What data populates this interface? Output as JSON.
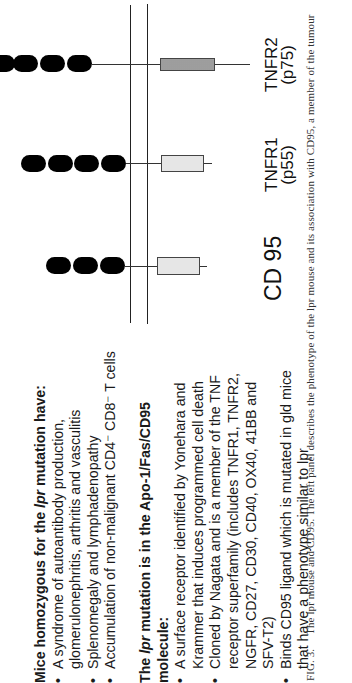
{
  "figure": {
    "orientation": "rotated-90-ccw",
    "receptors": [
      {
        "id": "tnfr2",
        "name": "TNFR2",
        "subname": "(p75)",
        "extracellular_domains": 4,
        "cytoplasmic_box": "dotted"
      },
      {
        "id": "tnfr1",
        "name": "TNFR1",
        "subname": "(p55)",
        "extracellular_domains": 4,
        "cytoplasmic_box": "light"
      },
      {
        "id": "cd95",
        "name": "CD 95",
        "subname": "",
        "extracellular_domains": 3,
        "cytoplasmic_box": "light"
      }
    ],
    "membrane": "double-line",
    "colors": {
      "domain": "#000000",
      "box_light": "#e6e6e6",
      "box_dotted": "#bdbdbd",
      "line": "#222222"
    }
  },
  "left_panel": {
    "section1": {
      "heading_pre": "Mice homozygous for the ",
      "heading_italic": "lpr",
      "heading_post": " mutation have:",
      "bullets": [
        [
          "A syndrome of autoantibody production,",
          "glomerulonephritis, arthritis and vasculitis"
        ],
        [
          "Splenomegaly and lymphadenopathy"
        ],
        [
          "Accumulation of non-malignant CD4⁻ CD8⁻ T cells"
        ]
      ]
    },
    "section2": {
      "heading_pre": "The ",
      "heading_italic": "lpr",
      "heading_post": " mutation is in the Apo-1/Fas/CD95",
      "heading_line2": "molecule:",
      "bullets": [
        [
          "A surface receptor identified by Yonehara and",
          "Krammer that induces programmed cell death"
        ],
        [
          "Cloned by Nagata and is a member of the TNF",
          "receptor superfamily (includes TNFR1, TNFR2,",
          "NGFR, CD27, CD30, CD40, OX40, 41BB and",
          "SFV-T2)"
        ],
        [
          "Binds CD95 ligand which is mutated in gld mice",
          "that have a phenotype similar to lpr"
        ]
      ]
    }
  },
  "caption": {
    "fig_label": "FIG. 3.",
    "text": "The lpr mouse and CD95. The left panel describes the phenotype of the lpr mouse and its association with CD95, a member of the tumour"
  }
}
